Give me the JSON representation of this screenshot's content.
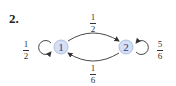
{
  "problem_number": "2.",
  "nodes": [
    {
      "id": "1",
      "label": "1",
      "cx": 61,
      "cy": 47
    },
    {
      "id": "2",
      "label": "2",
      "cx": 126,
      "cy": 47
    }
  ],
  "edges": [
    {
      "from": "1",
      "to": "1",
      "label": {
        "num": "1",
        "den": "2"
      }
    },
    {
      "from": "1",
      "to": "2",
      "label": {
        "num": "1",
        "den": "2"
      }
    },
    {
      "from": "2",
      "to": "1",
      "label": {
        "num": "1",
        "den": "6"
      }
    },
    {
      "from": "2",
      "to": "2",
      "label": {
        "num": "5",
        "den": "6"
      }
    }
  ],
  "colors": {
    "node_fill": "#d6e0f5",
    "node_stroke": "#9fb3dc",
    "node_text": "#2a3f7a",
    "edge": "#333333"
  }
}
